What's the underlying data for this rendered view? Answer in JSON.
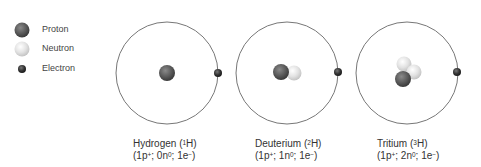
{
  "legend": {
    "items": [
      {
        "label": "Proton",
        "color": "#555555"
      },
      {
        "label": "Neutron",
        "color": "#e0e0e0"
      },
      {
        "label": "Electron",
        "color": "#333333"
      }
    ]
  },
  "atoms": [
    {
      "name": "Hydrogen",
      "symbol_mass": "1",
      "symbol": "H",
      "protons": "1p",
      "neutrons": "0n",
      "electrons": "1e",
      "center_x": 167
    },
    {
      "name": "Deuterium",
      "symbol_mass": "2",
      "symbol": "H",
      "protons": "1p",
      "neutrons": "1n",
      "electrons": "1e",
      "center_x": 287
    },
    {
      "name": "Tritium",
      "symbol_mass": "3",
      "symbol": "H",
      "protons": "1p",
      "neutrons": "2n",
      "electrons": "1e",
      "center_x": 407
    }
  ],
  "charges": {
    "plus": "+",
    "zero": "0",
    "minus": "−"
  }
}
